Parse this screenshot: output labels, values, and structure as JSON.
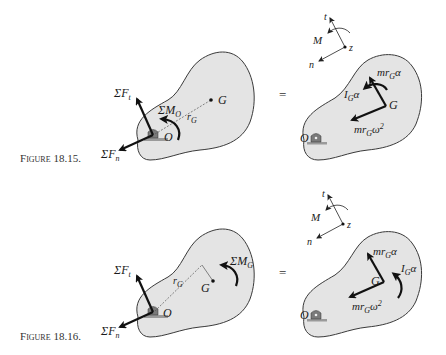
{
  "figures": [
    {
      "caption": "Figure 18.15.",
      "caption_small": "IGURE",
      "caption_first": "F",
      "caption_num": "18.15.",
      "left": {
        "force_t": "ΣF",
        "force_t_sub": "t",
        "force_n": "ΣF",
        "force_n_sub": "n",
        "moment": "ΣM",
        "moment_sub": "O",
        "radius": "r",
        "radius_sub": "G",
        "center": "G",
        "pivot": "O"
      },
      "equals": "=",
      "axes": {
        "t": "t",
        "n": "n",
        "z": "z",
        "M": "M"
      },
      "right": {
        "tangential": "mr",
        "tangential_sub": "G",
        "tangential_tail": "α",
        "normal": "mr",
        "normal_sub": "G",
        "normal_tail": "ω",
        "normal_exp": "2",
        "inertia": "I",
        "inertia_sub": "G",
        "inertia_tail": "α",
        "center": "G",
        "pivot": "O"
      }
    },
    {
      "caption": "Figure 18.16.",
      "caption_small": "IGURE",
      "caption_first": "F",
      "caption_num": "18.16.",
      "left": {
        "force_t": "ΣF",
        "force_t_sub": "t",
        "force_n": "ΣF",
        "force_n_sub": "n",
        "moment": "ΣM",
        "moment_sub": "G",
        "radius": "r",
        "radius_sub": "G",
        "center": "G",
        "pivot": "O"
      },
      "equals": "=",
      "axes": {
        "t": "t",
        "n": "n",
        "z": "z",
        "M": "M"
      },
      "right": {
        "tangential": "mr",
        "tangential_sub": "G",
        "tangential_tail": "α",
        "normal": "mr",
        "normal_sub": "G",
        "normal_tail": "ω",
        "normal_exp": "2",
        "inertia": "I",
        "inertia_sub": "G",
        "inertia_tail": "α",
        "center": "G",
        "pivot": "O"
      }
    }
  ],
  "colors": {
    "body_fill": "#e4e4e4",
    "outline": "#3a3a3a",
    "arrow": "#111111",
    "support": "#8a8a8a"
  }
}
